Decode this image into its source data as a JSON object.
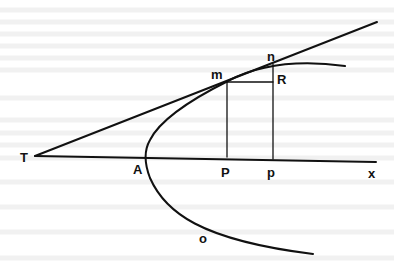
{
  "figure": {
    "labels": {
      "T": "T",
      "A": "A",
      "P": "P",
      "p": "p",
      "x": "x",
      "m": "m",
      "n": "n",
      "R": "R",
      "o": "o"
    },
    "colors": {
      "ink": "#111111",
      "background": "#ffffff",
      "faint_text": "#f0f0f0"
    }
  }
}
